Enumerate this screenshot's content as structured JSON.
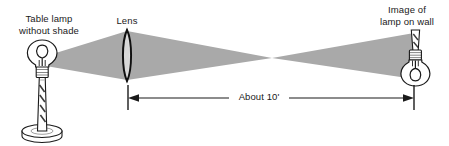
{
  "figure": {
    "width": 449,
    "height": 146,
    "background_color": "#ffffff",
    "ink_color": "#1a1a1a",
    "beam_color": "#a9a9a9"
  },
  "labels": {
    "source": "Table lamp\nwithout shade",
    "lens": "Lens",
    "image": "Image of\nlamp on wall",
    "distance": "About 10'"
  },
  "objects": {
    "source_lamp": {
      "name": "table lamp without shade",
      "orientation": "upright",
      "parts": [
        "bulb",
        "filament",
        "socket collar",
        "tapered stem",
        "round disc base"
      ]
    },
    "lens": {
      "name": "converging biconvex lens",
      "orientation": "vertical",
      "shape": "biconvex"
    },
    "image_lamp": {
      "name": "image of lamp on wall",
      "orientation": "inverted",
      "parts": [
        "stem",
        "socket collar",
        "bulb",
        "filament"
      ]
    }
  },
  "annotations": {
    "distance_arrow": {
      "label": "About 10'",
      "from": "lens",
      "to": "wall",
      "style": "double-headed arrow with end ticks"
    }
  },
  "beam": {
    "left_cone": "diverging from lamp bulb to full lens aperture",
    "right_cone": "converging from lens to focal crossing, then diverging to wall"
  }
}
